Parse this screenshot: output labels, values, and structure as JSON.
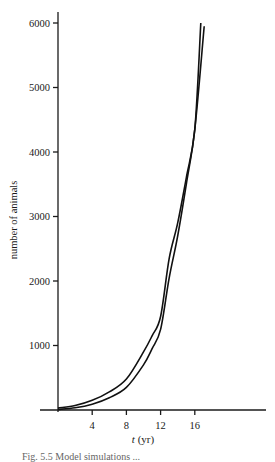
{
  "chart_data": {
    "type": "line",
    "title": "",
    "xlabel": "t (yr)",
    "ylabel": "number of animals",
    "xlim": [
      0,
      24
    ],
    "ylim": [
      0,
      6000
    ],
    "x_ticks": [
      4,
      8,
      12,
      16
    ],
    "y_ticks": [
      1000,
      2000,
      3000,
      4000,
      5000,
      6000
    ],
    "grid": false,
    "legend": null,
    "series": [
      {
        "name": "curve A (rises earlier)",
        "x": [
          0,
          2,
          4,
          6,
          8,
          10,
          11,
          12,
          13,
          14,
          15,
          16,
          16.7
        ],
        "values": [
          30,
          70,
          150,
          280,
          480,
          900,
          1150,
          1450,
          2350,
          2900,
          3600,
          4350,
          6000
        ]
      },
      {
        "name": "curve B (rises later)",
        "x": [
          0,
          2,
          4,
          6,
          8,
          10,
          11,
          12,
          13,
          14,
          15,
          16,
          17.1
        ],
        "values": [
          10,
          35,
          90,
          190,
          350,
          700,
          950,
          1250,
          2050,
          2700,
          3500,
          4350,
          5950
        ]
      }
    ]
  },
  "labels": {
    "ylabel": "number of animals",
    "xlabel_var": "t",
    "xlabel_unit": " (yr)",
    "caption": "Fig. 5.5  Model simulations ..."
  }
}
